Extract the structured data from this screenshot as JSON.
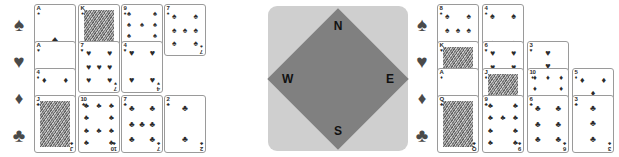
{
  "colors": {
    "card_face": "#ffffff",
    "card_border": "#9a9a9a",
    "pip_dark": "#2b2b2b",
    "suit_marker": "#4a4a4a",
    "compass_outer": "#cfcfcf",
    "compass_inner": "#808080",
    "compass_label": "#111111",
    "background": "#ffffff"
  },
  "compass": {
    "north_label": "N",
    "south_label": "S",
    "west_label": "W",
    "east_label": "E"
  },
  "suit_glyphs": {
    "spade": "♠",
    "heart": "♥",
    "diamond": "♦",
    "club": "♣"
  },
  "hands": {
    "west": {
      "name": "west-hand",
      "suit_markers": [
        {
          "name": "spade-marker",
          "glyph": "♠"
        },
        {
          "name": "heart-marker",
          "glyph": "♥"
        },
        {
          "name": "diamond-marker",
          "glyph": "♦"
        },
        {
          "name": "club-marker",
          "glyph": "♣"
        }
      ],
      "rows": [
        {
          "suit": "spade",
          "suit_glyph": "♠",
          "cards": [
            {
              "rank": "A",
              "suit_glyph": "♠",
              "court": false,
              "pip_count": 1
            },
            {
              "rank": "K",
              "suit_glyph": "♠",
              "court": true,
              "pip_count": 0
            },
            {
              "rank": "9",
              "suit_glyph": "♠",
              "court": false,
              "pip_count": 9
            },
            {
              "rank": "7",
              "suit_glyph": "♠",
              "court": false,
              "pip_count": 7
            }
          ]
        },
        {
          "suit": "heart",
          "suit_glyph": "♥",
          "cards": [
            {
              "rank": "A",
              "suit_glyph": "♥",
              "court": false,
              "pip_count": 1
            },
            {
              "rank": "7",
              "suit_glyph": "♥",
              "court": false,
              "pip_count": 7
            },
            {
              "rank": "4",
              "suit_glyph": "♥",
              "court": false,
              "pip_count": 4
            }
          ]
        },
        {
          "suit": "diamond",
          "suit_glyph": "♦",
          "cards": [
            {
              "rank": "4",
              "suit_glyph": "♦",
              "court": false,
              "pip_count": 4
            }
          ]
        },
        {
          "suit": "club",
          "suit_glyph": "♣",
          "cards": [
            {
              "rank": "J",
              "suit_glyph": "♣",
              "court": true,
              "pip_count": 0
            },
            {
              "rank": "10",
              "suit_glyph": "♣",
              "court": false,
              "pip_count": 10
            },
            {
              "rank": "7",
              "suit_glyph": "♣",
              "court": false,
              "pip_count": 7
            },
            {
              "rank": "2",
              "suit_glyph": "♣",
              "court": false,
              "pip_count": 2
            }
          ]
        }
      ]
    },
    "east": {
      "name": "east-hand",
      "suit_markers": [
        {
          "name": "spade-marker",
          "glyph": "♠"
        },
        {
          "name": "heart-marker",
          "glyph": "♥"
        },
        {
          "name": "diamond-marker",
          "glyph": "♦"
        },
        {
          "name": "club-marker",
          "glyph": "♣"
        }
      ],
      "rows": [
        {
          "suit": "spade",
          "suit_glyph": "♠",
          "cards": [
            {
              "rank": "8",
              "suit_glyph": "♠",
              "court": false,
              "pip_count": 8
            },
            {
              "rank": "4",
              "suit_glyph": "♠",
              "court": false,
              "pip_count": 4
            }
          ]
        },
        {
          "suit": "heart",
          "suit_glyph": "♥",
          "cards": [
            {
              "rank": "K",
              "suit_glyph": "♥",
              "court": true,
              "pip_count": 0
            },
            {
              "rank": "6",
              "suit_glyph": "♥",
              "court": false,
              "pip_count": 6
            },
            {
              "rank": "3",
              "suit_glyph": "♥",
              "court": false,
              "pip_count": 3
            }
          ]
        },
        {
          "suit": "diamond",
          "suit_glyph": "♦",
          "cards": [
            {
              "rank": "A",
              "suit_glyph": "♦",
              "court": false,
              "pip_count": 1
            },
            {
              "rank": "J",
              "suit_glyph": "♦",
              "court": true,
              "pip_count": 0
            },
            {
              "rank": "10",
              "suit_glyph": "♦",
              "court": false,
              "pip_count": 10
            },
            {
              "rank": "5",
              "suit_glyph": "♦",
              "court": false,
              "pip_count": 5
            }
          ]
        },
        {
          "suit": "club",
          "suit_glyph": "♣",
          "cards": [
            {
              "rank": "Q",
              "suit_glyph": "♣",
              "court": true,
              "pip_count": 0
            },
            {
              "rank": "9",
              "suit_glyph": "♣",
              "court": false,
              "pip_count": 9
            },
            {
              "rank": "6",
              "suit_glyph": "♣",
              "court": false,
              "pip_count": 6
            },
            {
              "rank": "3",
              "suit_glyph": "♣",
              "court": false,
              "pip_count": 3
            }
          ]
        }
      ]
    }
  },
  "layout": {
    "west_columns_x": [
      0,
      44,
      87,
      130
    ],
    "east_columns_x": [
      0,
      45,
      90,
      135
    ],
    "card_width": 42,
    "row_tops": [
      4,
      41,
      68,
      95
    ],
    "row_heights": [
      40,
      40,
      40,
      58
    ]
  }
}
